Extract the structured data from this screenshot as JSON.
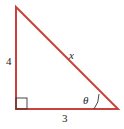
{
  "diagram": {
    "type": "right-triangle",
    "stroke_color": "#c8443a",
    "label_color": "#222222",
    "vertices": {
      "top": [
        16,
        7
      ],
      "right_angle": [
        16,
        109
      ],
      "bottom_right": [
        118,
        109
      ]
    },
    "labels": {
      "vertical_side": "4",
      "hypotenuse": "x",
      "horizontal_side": "3",
      "angle": "θ"
    }
  }
}
